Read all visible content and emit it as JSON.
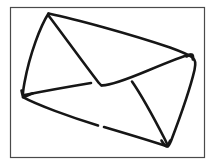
{
  "image": {
    "title": "Envelope line drawing",
    "subject": "envelope",
    "style": "hand-drawn black ink sketch",
    "width": 215,
    "height": 167,
    "background_color": "#ffffff"
  },
  "frame": {
    "name": "border frame",
    "stroke_color": "#4a4a4a",
    "fill_color": "#ffffff",
    "stroke_width": 1.2,
    "x": 10.5,
    "y": 7.5,
    "width": 194,
    "height": 150
  },
  "drawing": {
    "stroke_color": "#161616",
    "stroke_width": 2.6,
    "strokes": [
      {
        "name": "envelope-outline-top-left-edge",
        "description": "left slanted edge from top apex down to left corner",
        "d": "M48.5,13.5 C40.5,26 30,53 24.5,82.5 C23.2,89.5 22.6,94 23.0,97.2"
      },
      {
        "name": "envelope-outline-top-edge",
        "description": "long top edge from top-left apex to right corner",
        "d": "M48.5,13.5 C75,19 130,34 170,47.5 C181,51.5 189,55 192.5,57.5"
      },
      {
        "name": "envelope-outline-right-edge",
        "description": "right edge from right corner down to bottom-right corner",
        "d": "M192.5,57.5 C195.5,60.5 196,63 194.5,70 C191,85 179,120 171,141 C169.5,144.5 168.8,145.8 168,146.2"
      },
      {
        "name": "envelope-outline-bottom-edge-left-segment",
        "description": "bottom edge from left corner rightwards, with a small gap",
        "d": "M23.0,97.2 C36,104.5 70,117 98,125.5"
      },
      {
        "name": "envelope-outline-bottom-edge-right-segment",
        "description": "bottom edge continuing to the bottom-right corner",
        "d": "M104,127 C126,133.5 154,142 167.5,146.5"
      },
      {
        "name": "flap-left-diagonal",
        "description": "flap crease from top apex down to flap bottom point",
        "d": "M48.5,15.5 C61,32 85,65 97,80.5 C99,83.2 100.2,84.6 101.5,85.3"
      },
      {
        "name": "flap-right-diagonal",
        "description": "flap crease from flap bottom point up to right corner",
        "d": "M101.5,85.3 C108,86 124,80.5 148,70.5 C170,61.3 184,55.8 190.5,54.5"
      },
      {
        "name": "body-left-diagonal",
        "description": "inner fold from left corner up toward flap bottom",
        "d": "M24.5,95.0 C42,91.5 70,86.5 91,83.0"
      },
      {
        "name": "body-right-diagonal",
        "description": "inner fold from under the flap down to bottom-right corner",
        "d": "M132,81.5 C140,93 156,122 165,139.5 C166.5,142.5 167.2,144.2 167.5,145.5"
      },
      {
        "name": "left-corner-tick",
        "description": "small hook flourish at the left corner",
        "d": "M21.5,90.5 C22.2,94.5 22.8,96.5 24.0,97.0 C26.5,96.0 30,94.5 33,93.3"
      },
      {
        "name": "right-corner-tick",
        "description": "small hook flourish at the right corner",
        "d": "M186.5,56.5 C189.5,54.8 191.2,54.2 192.3,54.6 C193.2,55.4 193.2,57.2 192.8,59.5"
      },
      {
        "name": "bottom-corner-tick",
        "description": "small hook flourish at the bottom-right corner",
        "d": "M161.5,140.5 C163.5,144 165,145.8 166.5,146.2 C167.8,145.4 169,143.5 170.2,140.5"
      }
    ]
  }
}
